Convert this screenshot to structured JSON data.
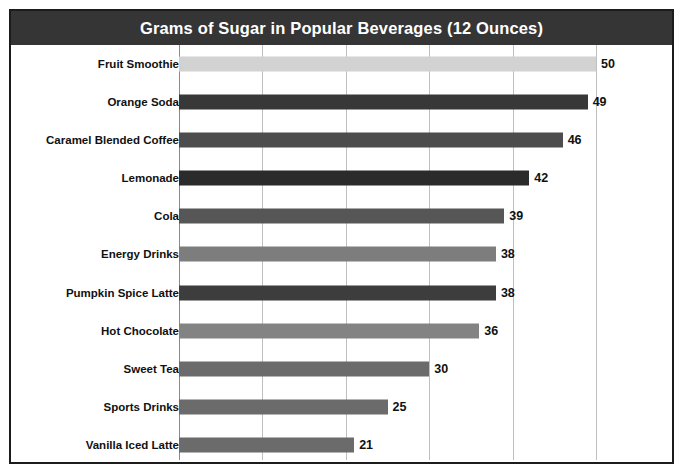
{
  "chart_data": {
    "type": "bar",
    "orientation": "horizontal",
    "title": "Grams of Sugar in Popular Beverages (12 Ounces)",
    "xlabel": "",
    "ylabel": "",
    "xlim": [
      0,
      60
    ],
    "grid": true,
    "gridline_values": [
      0,
      10,
      20,
      30,
      40,
      50
    ],
    "legend": null,
    "categories": [
      "Fruit Smoothie",
      "Orange Soda",
      "Caramel Blended Coffee",
      "Lemonade",
      "Cola",
      "Energy Drinks",
      "Pumpkin Spice Latte",
      "Hot Chocolate",
      "Sweet Tea",
      "Sports Drinks",
      "Vanilla Iced Latte"
    ],
    "values": [
      50,
      49,
      46,
      42,
      39,
      38,
      38,
      36,
      30,
      25,
      21
    ],
    "bar_colors": [
      "#d2d2d2",
      "#383838",
      "#4d4d4d",
      "#2b2b2b",
      "#565656",
      "#7d7d7d",
      "#3d3d3d",
      "#838383",
      "#6b6b6b",
      "#6b6b6b",
      "#6b6b6b"
    ],
    "data_labels": [
      "50",
      "49",
      "46",
      "42",
      "39",
      "38",
      "38",
      "36",
      "30",
      "25",
      "21"
    ]
  },
  "style": {
    "title_bar_background": "#353535",
    "title_text_color": "#ffffff",
    "frame_border_color": "#1c1c1c",
    "gridline_color": "#bfbfbf",
    "plot_background": "#ffffff",
    "label_text_color": "#111111"
  }
}
